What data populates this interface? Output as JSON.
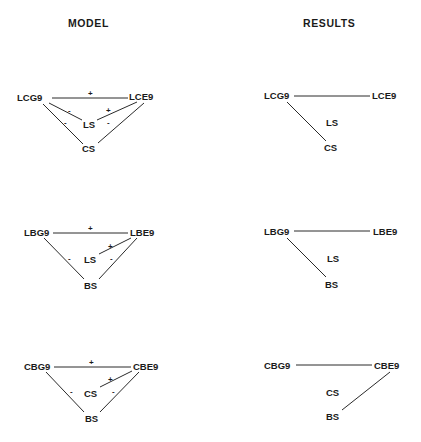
{
  "headers": {
    "model": "MODEL",
    "results": "RESULTS"
  },
  "colors": {
    "ink": "#1a1a1a",
    "background": "#ffffff"
  },
  "model": [
    {
      "nodes": {
        "left": "LCG9",
        "right": "LCE9",
        "middle": "LS",
        "bottom": "CS"
      },
      "edges": [
        {
          "from": "LCG9",
          "to": "LCE9",
          "sign": "+"
        },
        {
          "from": "LCG9",
          "to": "LS",
          "sign": "-"
        },
        {
          "from": "LCE9",
          "to": "LS",
          "sign": "+"
        },
        {
          "from": "LCG9",
          "to": "CS",
          "sign": "-"
        },
        {
          "from": "LCE9",
          "to": "CS",
          "sign": "-"
        }
      ],
      "signs": {
        "top": "+",
        "left_middle": "-",
        "right_middle": "+",
        "left_bottom": "-",
        "right_bottom": "-"
      }
    },
    {
      "nodes": {
        "left": "LBG9",
        "right": "LBE9",
        "middle": "LS",
        "bottom": "BS"
      },
      "edges": [
        {
          "from": "LBG9",
          "to": "LBE9",
          "sign": "+"
        },
        {
          "from": "LBE9",
          "to": "LS",
          "sign": "+"
        },
        {
          "from": "LBG9",
          "to": "BS",
          "sign": "-"
        },
        {
          "from": "LBE9",
          "to": "BS",
          "sign": "-"
        }
      ],
      "signs": {
        "top": "+",
        "right_middle": "+",
        "left_bottom": "-",
        "right_bottom": "-"
      }
    },
    {
      "nodes": {
        "left": "CBG9",
        "right": "CBE9",
        "middle": "CS",
        "bottom": "BS"
      },
      "edges": [
        {
          "from": "CBG9",
          "to": "CBE9",
          "sign": "+"
        },
        {
          "from": "CBE9",
          "to": "CS",
          "sign": "+"
        },
        {
          "from": "CBG9",
          "to": "BS",
          "sign": "-"
        },
        {
          "from": "CBE9",
          "to": "BS",
          "sign": "-"
        }
      ],
      "signs": {
        "top": "+",
        "right_middle": "+",
        "left_bottom": "-",
        "right_bottom": "-"
      }
    }
  ],
  "results": [
    {
      "nodes": {
        "left": "LCG9",
        "right": "LCE9",
        "middle": "LS",
        "bottom": "CS"
      },
      "edges": [
        {
          "from": "LCG9",
          "to": "LCE9"
        },
        {
          "from": "LCG9",
          "to": "CS"
        }
      ]
    },
    {
      "nodes": {
        "left": "LBG9",
        "right": "LBE9",
        "middle": "LS",
        "bottom": "BS"
      },
      "edges": [
        {
          "from": "LBG9",
          "to": "LBE9"
        },
        {
          "from": "LBG9",
          "to": "BS"
        }
      ]
    },
    {
      "nodes": {
        "left": "CBG9",
        "right": "CBE9",
        "middle": "CS",
        "bottom": "BS"
      },
      "edges": [
        {
          "from": "CBG9",
          "to": "CBE9"
        },
        {
          "from": "CBE9",
          "to": "BS"
        }
      ]
    }
  ]
}
